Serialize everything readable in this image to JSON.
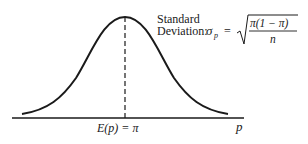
{
  "diagram": {
    "type": "normal-distribution-curve",
    "sd_label_line1": "Standard",
    "sd_label_line2": "Deviation:",
    "sd_symbol": "σ",
    "sd_subscript": "p",
    "equals": "=",
    "formula_numerator": "π(1 − π)",
    "formula_denominator": "n",
    "mean_label": "E(p) = π",
    "x_axis_label": "p",
    "colors": {
      "ink": "#1a1a1a",
      "background": "#ffffff"
    }
  }
}
